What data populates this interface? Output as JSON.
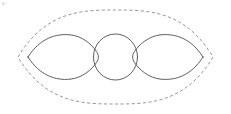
{
  "figure": {
    "title": "Three tangent regions enclosed by a dashed lens-shaped boundary",
    "background_color": "#ffffff",
    "width": 231,
    "height": 114,
    "stroke_color": "#4d4d4d",
    "boundary_color": "#8c8c8c"
  },
  "boundary": {
    "label": "dashed-outer-lens",
    "style": "dashed",
    "dash_pattern": "3.2 2.4",
    "left_tip": {
      "x": 18,
      "y": 57
    },
    "right_tip": {
      "x": 213,
      "y": 57
    },
    "top_apex": {
      "x": 115.5,
      "y": 10
    },
    "bottom_apex": {
      "x": 115.5,
      "y": 104
    },
    "path": "M 18 57 C 46 10 84 10 115.5 10 C 147 10 185 10 213 57 C 185 104 147 104 115.5 104 C 84 104 46 104 18 57 Z"
  },
  "shapes": [
    {
      "name": "left-petal",
      "type": "lens",
      "style": "solid",
      "left_tip": {
        "x": 28,
        "y": 57
      },
      "right_edge": {
        "x": 96,
        "y": 57
      },
      "top_apex": {
        "x": 64,
        "y": 37
      },
      "bottom_apex": {
        "x": 64,
        "y": 78
      },
      "path": "M 28 57 C 40 38 56 33.5 70 34.8 C 82 36 91.5 44 96.5 51.5 C 99 55 99 59 96.5 62.5 C 91.5 70 82 78 70 79.2 C 56 80.5 40 76 28 57 Z"
    },
    {
      "name": "center-circle",
      "type": "circle",
      "style": "solid",
      "center": {
        "x": 115.5,
        "y": 57
      },
      "radius_x": 22,
      "radius_y": 23,
      "bounds": {
        "left": 93.5,
        "right": 137.5,
        "top": 34,
        "bottom": 80
      }
    },
    {
      "name": "right-petal",
      "type": "lens",
      "style": "solid",
      "right_tip": {
        "x": 203,
        "y": 57
      },
      "left_edge": {
        "x": 135,
        "y": 57
      },
      "top_apex": {
        "x": 167,
        "y": 37
      },
      "bottom_apex": {
        "x": 167,
        "y": 78
      },
      "path": "M 203 57 C 191 38 175 33.5 161 34.8 C 149 36 139.5 44 134.5 51.5 C 132 55 132 59 134.5 62.5 C 139.5 70 149 78 161 79.2 C 175 80.5 191 76 203 57 Z"
    }
  ],
  "artifacts": [
    {
      "name": "corner-smudge",
      "description": "faint scan smudge",
      "x": 1,
      "y": 1
    }
  ]
}
